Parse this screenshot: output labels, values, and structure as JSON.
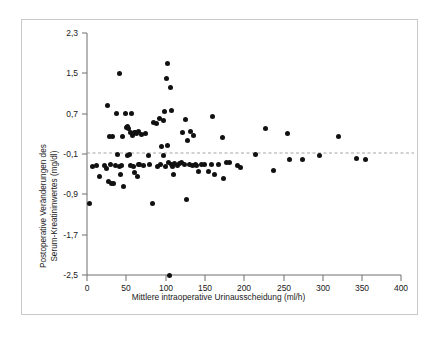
{
  "figure": {
    "background_color": "#ffffff",
    "frame_color": "#c9c9c9",
    "marker_color": "#111111",
    "axis_color": "#6e6e6e",
    "reference_line_color": "#9a9a9a"
  },
  "chart_data": {
    "type": "scatter",
    "title": "",
    "xlabel": "Mittlere intraoperative Urinausscheidung (ml/h)",
    "ylabel": "Postoperative Veränderungen des Serum-Kreatininwertes (mg/dl)",
    "ylabel_line1": "Postoperative Veränderungen des",
    "ylabel_line2": "Serum-Kreatininwertes (mg/dl)",
    "xlim": [
      0,
      400
    ],
    "ylim": [
      -2.5,
      2.3
    ],
    "xticks": [
      0,
      50,
      100,
      150,
      200,
      250,
      300,
      350,
      400
    ],
    "yticks": [
      -2.5,
      -1.7,
      -0.9,
      -0.1,
      0.7,
      1.5,
      2.3
    ],
    "xtick_labels": [
      "0",
      "50",
      "100",
      "150",
      "200",
      "250",
      "300",
      "350",
      "400"
    ],
    "ytick_labels": [
      "-2,5",
      "-1,7",
      "-0,9",
      "-0,1",
      "0,7",
      "1,5",
      "2,3"
    ],
    "grid": false,
    "legend": "none",
    "reference_line": {
      "orientation": "horizontal",
      "y": 0.02,
      "style": "dashed"
    },
    "marker": {
      "shape": "circle",
      "size": 5,
      "color": "#111111"
    },
    "points": [
      [
        3,
        -1.08
      ],
      [
        7,
        -0.35
      ],
      [
        12,
        -0.32
      ],
      [
        16,
        -0.55
      ],
      [
        22,
        -0.33
      ],
      [
        25,
        -0.38
      ],
      [
        26,
        0.86
      ],
      [
        27,
        -0.65
      ],
      [
        29,
        0.25
      ],
      [
        30,
        -0.3
      ],
      [
        31,
        -0.68
      ],
      [
        33,
        0.25
      ],
      [
        34,
        -0.68
      ],
      [
        36,
        -0.32
      ],
      [
        38,
        0.7
      ],
      [
        39,
        -0.1
      ],
      [
        41,
        -0.35
      ],
      [
        42,
        1.5
      ],
      [
        43,
        -0.5
      ],
      [
        44,
        -0.33
      ],
      [
        45,
        0.24
      ],
      [
        47,
        -0.75
      ],
      [
        49,
        0.71
      ],
      [
        50,
        0.42
      ],
      [
        51,
        -0.12
      ],
      [
        52,
        0.45
      ],
      [
        53,
        0.4
      ],
      [
        54,
        -0.1
      ],
      [
        55,
        -0.33
      ],
      [
        56,
        0.33
      ],
      [
        57,
        0.7
      ],
      [
        58,
        0.27
      ],
      [
        59,
        -0.34
      ],
      [
        60,
        0.32
      ],
      [
        61,
        -0.46
      ],
      [
        62,
        0.33
      ],
      [
        63,
        0.3
      ],
      [
        64,
        -0.55
      ],
      [
        65,
        -0.3
      ],
      [
        66,
        0.34
      ],
      [
        67,
        -0.31
      ],
      [
        70,
        0.28
      ],
      [
        72,
        -0.32
      ],
      [
        75,
        0.3
      ],
      [
        78,
        -0.13
      ],
      [
        80,
        -0.3
      ],
      [
        83,
        -1.08
      ],
      [
        85,
        0.52
      ],
      [
        88,
        0.5
      ],
      [
        90,
        -0.34
      ],
      [
        92,
        0.6
      ],
      [
        93,
        -0.3
      ],
      [
        95,
        0.05
      ],
      [
        97,
        0.56
      ],
      [
        98,
        -0.12
      ],
      [
        99,
        0.74
      ],
      [
        100,
        -0.35
      ],
      [
        101,
        1.4
      ],
      [
        102,
        0.07
      ],
      [
        103,
        1.7
      ],
      [
        104,
        -0.26
      ],
      [
        105,
        -2.5
      ],
      [
        106,
        1.22
      ],
      [
        107,
        -0.3
      ],
      [
        108,
        0.77
      ],
      [
        109,
        -0.35
      ],
      [
        110,
        -0.5
      ],
      [
        112,
        -0.28
      ],
      [
        115,
        -0.32
      ],
      [
        118,
        -0.28
      ],
      [
        120,
        -0.26
      ],
      [
        122,
        0.33
      ],
      [
        124,
        -0.3
      ],
      [
        126,
        0.58
      ],
      [
        127,
        -1.0
      ],
      [
        128,
        0.17
      ],
      [
        130,
        -0.31
      ],
      [
        132,
        0.34
      ],
      [
        134,
        -0.32
      ],
      [
        136,
        0.27
      ],
      [
        138,
        -0.31
      ],
      [
        140,
        -0.33
      ],
      [
        142,
        -0.44
      ],
      [
        146,
        -0.3
      ],
      [
        150,
        -0.31
      ],
      [
        155,
        -0.45
      ],
      [
        158,
        -0.3
      ],
      [
        160,
        0.64
      ],
      [
        162,
        -0.5
      ],
      [
        168,
        -0.31
      ],
      [
        172,
        0.22
      ],
      [
        174,
        -0.58
      ],
      [
        178,
        -0.27
      ],
      [
        182,
        -0.27
      ],
      [
        192,
        -0.33
      ],
      [
        196,
        -0.37
      ],
      [
        215,
        -0.11
      ],
      [
        228,
        0.4
      ],
      [
        237,
        -0.43
      ],
      [
        255,
        0.3
      ],
      [
        258,
        -0.2
      ],
      [
        275,
        -0.2
      ],
      [
        296,
        -0.12
      ],
      [
        320,
        0.24
      ],
      [
        343,
        -0.18
      ],
      [
        355,
        -0.2
      ]
    ]
  }
}
